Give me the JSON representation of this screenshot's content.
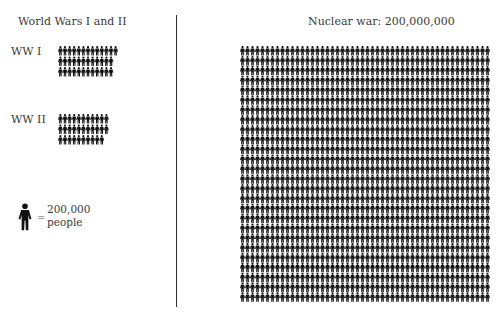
{
  "chart_data": {
    "type": "pictogram",
    "left_title": "World Wars I and II",
    "right_title": "Nuclear war: 200,000,000",
    "unit": {
      "icon": "person-icon",
      "equals": "=",
      "value_label": "200,000",
      "unit_label": "people",
      "value": 200000
    },
    "series": [
      {
        "name": "WW I",
        "rows": [
          13,
          12,
          12
        ]
      },
      {
        "name": "WW II",
        "rows": [
          11,
          11,
          10
        ]
      },
      {
        "name": "Nuclear war",
        "icons": 1000,
        "columns": 50,
        "row_count": 26,
        "total_people": 200000000
      }
    ]
  }
}
